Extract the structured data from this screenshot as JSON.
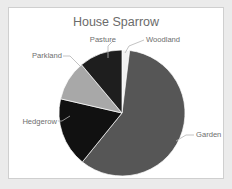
{
  "figure": {
    "background_color": "#ebebeb",
    "panel_color": "#ffffff",
    "panel_border_color": "#cfcfcf"
  },
  "chart_data": {
    "type": "pie",
    "title": "House Sparrow",
    "xlabel": "",
    "ylabel": "",
    "legend_position": "none",
    "grid": false,
    "labels_outside": true,
    "start_angle_deg": 0,
    "direction": "clockwise",
    "categories": [
      "Woodland",
      "Garden",
      "Hedgerow",
      "Parkland",
      "Pasture"
    ],
    "values": [
      2,
      59,
      18,
      10,
      11
    ],
    "colors": [
      "#f2f2f2",
      "#565656",
      "#111111",
      "#a8a8a8",
      "#1e1e1e"
    ],
    "slices": [
      {
        "name": "Woodland",
        "label": "Woodland",
        "value": 2,
        "color": "#f2f2f2",
        "start_deg": 0,
        "end_deg": 7,
        "label_x": 146,
        "label_y": 42,
        "label_anchor": "start",
        "leader": "M 125,53 L 129,46 L 144,40"
      },
      {
        "name": "Garden",
        "label": "Garden",
        "value": 59,
        "color": "#565656",
        "start_deg": 7,
        "end_deg": 219,
        "label_x": 196,
        "label_y": 137,
        "label_anchor": "start",
        "leader": "M 176,141 L 186,135 L 194,135"
      },
      {
        "name": "Hedgerow",
        "label": "Hedgerow",
        "value": 18,
        "color": "#111111",
        "start_deg": 219,
        "end_deg": 283,
        "label_x": 57,
        "label_y": 124,
        "label_anchor": "end",
        "leader": "M 70,116 L 62,121 L 58,121"
      },
      {
        "name": "Parkland",
        "label": "Parkland",
        "value": 10,
        "color": "#a8a8a8",
        "start_deg": 283,
        "end_deg": 320,
        "label_x": 62,
        "label_y": 58,
        "label_anchor": "end",
        "leader": "M 80,66 L 70,56 L 63,56"
      },
      {
        "name": "Pasture",
        "label": "Pasture",
        "value": 11,
        "color": "#1e1e1e",
        "start_deg": 320,
        "end_deg": 360,
        "label_x": 116,
        "label_y": 42,
        "label_anchor": "end",
        "leader": "M 108,58 L 108,46 L 113,41"
      }
    ],
    "geometry": {
      "center_x": 122,
      "center_y": 113,
      "radius": 63
    }
  }
}
